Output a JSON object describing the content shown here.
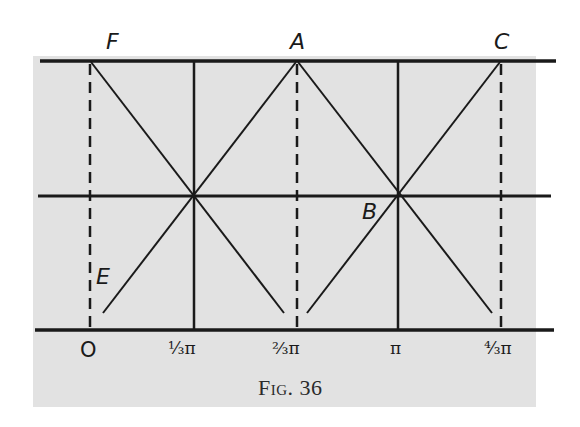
{
  "figure": {
    "caption": "Fig. 36",
    "background_color": "#e2e2e2",
    "line_color": "#1a1a1a"
  },
  "points": {
    "F": "F",
    "A": "A",
    "C": "C",
    "B": "B",
    "E": "E"
  },
  "axis": {
    "origin": "O",
    "ticks": [
      "⅓π",
      "⅔π",
      "π",
      "⁴⁄₃π"
    ]
  },
  "geometry": {
    "horizontal_lines": [
      "top",
      "middle",
      "bottom (axis)"
    ],
    "solid_verticals_at": [
      "⅓π",
      "π"
    ],
    "dashed_verticals_at": [
      "O",
      "⅔π",
      "⁴⁄₃π"
    ],
    "segments": [
      "F–B1–(⅔π)",
      "A–B1–E",
      "A–B–(⁴⁄₃π)",
      "C–B–(⅔π)"
    ]
  }
}
